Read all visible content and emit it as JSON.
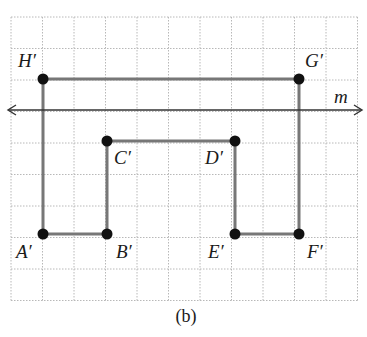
{
  "figure": {
    "caption": "(b)",
    "grid": {
      "x0": 11,
      "y0": 17,
      "cell": 31.5,
      "cols": 11,
      "rows": 9,
      "color": "#b8b8b8"
    },
    "line_m": {
      "label": "m",
      "y": 110,
      "x_start": 8,
      "x_end": 362,
      "color": "#333333"
    },
    "shape_color": "#777777",
    "point_color": "#111111",
    "points": [
      {
        "id": "H",
        "label": "H′",
        "x": 43,
        "y": 79,
        "lx": 18,
        "ly": 67
      },
      {
        "id": "G",
        "label": "G′",
        "x": 299,
        "y": 79,
        "lx": 305,
        "ly": 67
      },
      {
        "id": "C",
        "label": "C′",
        "x": 107,
        "y": 141,
        "lx": 114,
        "ly": 164
      },
      {
        "id": "D",
        "label": "D′",
        "x": 235,
        "y": 141,
        "lx": 205,
        "ly": 164
      },
      {
        "id": "A",
        "label": "A′",
        "x": 43,
        "y": 234,
        "lx": 16,
        "ly": 258
      },
      {
        "id": "B",
        "label": "B′",
        "x": 107,
        "y": 234,
        "lx": 116,
        "ly": 258
      },
      {
        "id": "E",
        "label": "E′",
        "x": 235,
        "y": 234,
        "lx": 208,
        "ly": 258
      },
      {
        "id": "F",
        "label": "F′",
        "x": 299,
        "y": 234,
        "lx": 307,
        "ly": 258
      }
    ],
    "polygon_order": [
      "A",
      "B",
      "C",
      "D",
      "E",
      "F",
      "G",
      "H"
    ]
  }
}
